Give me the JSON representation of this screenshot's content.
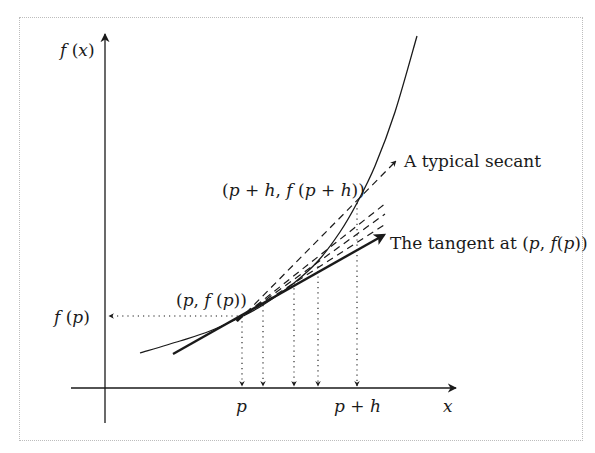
{
  "diagram": {
    "axes": {
      "y_label": "f (x)",
      "x_label": "x",
      "x_ticks": [
        {
          "label": "p",
          "x": 242
        },
        {
          "label": "p + h",
          "x": 357
        }
      ],
      "y_ticks": [
        {
          "label": "f (p)",
          "y": 316
        }
      ]
    },
    "points": {
      "p": {
        "label": "(p, f (p))",
        "x": 243,
        "y": 316
      },
      "p_plus_h": {
        "label": "(p + h, f (p + h))",
        "x": 357,
        "y": 203
      }
    },
    "annotations": {
      "secant": "A typical secant",
      "tangent": "The tangent at (p, f (p))"
    },
    "curve_points": [
      [
        140,
        353
      ],
      [
        180,
        341
      ],
      [
        210,
        331
      ],
      [
        243,
        316
      ],
      [
        263,
        305
      ],
      [
        294,
        283
      ],
      [
        318,
        261
      ],
      [
        340,
        232
      ],
      [
        357,
        203
      ],
      [
        375,
        166
      ],
      [
        395,
        112
      ],
      [
        417,
        36
      ]
    ],
    "secant_ends": [
      [
        396,
        161
      ],
      [
        386,
        203
      ],
      [
        385,
        214
      ],
      [
        384,
        225
      ]
    ],
    "tangent": {
      "from": [
        173,
        354
      ],
      "to": [
        384,
        235
      ]
    },
    "drop_lines_x": [
      242,
      263,
      294,
      318,
      357
    ],
    "colors": {
      "line": "#1a1a1a",
      "frame": "#bdbdbd"
    }
  }
}
